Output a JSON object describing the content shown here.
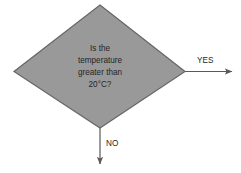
{
  "diagram": {
    "type": "flowchart",
    "background_color": "#FFFFFF",
    "decision": {
      "shape": "diamond",
      "fill_color": "#999999",
      "stroke_color": "#666666",
      "text_lines": [
        "Is the",
        "temperature",
        "greater than",
        "20°C?"
      ],
      "full_text": "Is the temperature greater than 20°C?"
    },
    "edges": [
      {
        "id": "yes-edge",
        "label": "YES",
        "direction": "right",
        "color": "#595959"
      },
      {
        "id": "no-edge",
        "label": "NO",
        "direction": "down",
        "color": "#595959"
      }
    ]
  }
}
